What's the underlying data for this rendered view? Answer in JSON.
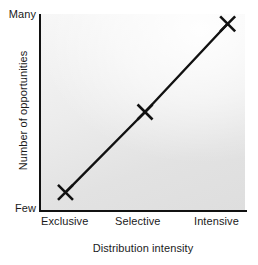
{
  "chart_data": {
    "type": "line",
    "title": "",
    "subtitle": "",
    "xlabel": "Distribution intensity",
    "ylabel": "Number of opportunities",
    "categories": [
      "Exclusive",
      "Selective",
      "Intensive"
    ],
    "values": [
      1,
      3,
      5
    ],
    "ylim": [
      0,
      5.6
    ],
    "ytick_labels": [
      "Few",
      "Many"
    ],
    "ytick_low": "Few",
    "ytick_high": "Many",
    "xtick_labels": [
      "Exclusive",
      "Selective",
      "Intensive"
    ],
    "series": [
      {
        "name": "Number of opportunities",
        "values": [
          1,
          3,
          5
        ],
        "marker": "x",
        "marker_color": "#111111",
        "line_color": "#111111",
        "line_width": 2.4
      }
    ],
    "points": [
      {
        "x": "Exclusive",
        "x_frac": 0.12,
        "y_frac": 0.09
      },
      {
        "x": "Selective",
        "x_frac": 0.51,
        "y_frac": 0.5
      },
      {
        "x": "Intensive",
        "x_frac": 0.915,
        "y_frac": 0.95
      }
    ],
    "grid": false,
    "legend": false,
    "legend_position": "none",
    "annotations": [],
    "colors": {
      "line": "#111111",
      "marker": "#111111",
      "axis": "#111111",
      "plot_background_light": "#f6f6f6",
      "plot_background_dark": "#dedede",
      "figure_background": "#ffffff",
      "text": "#1a1a1a"
    }
  },
  "axes": {
    "y_title": "Number of opportunities",
    "y_high_label": "Many",
    "y_low_label": "Few",
    "x_title": "Distribution intensity",
    "x_labels": [
      "Exclusive",
      "Selective",
      "Intensive"
    ]
  }
}
